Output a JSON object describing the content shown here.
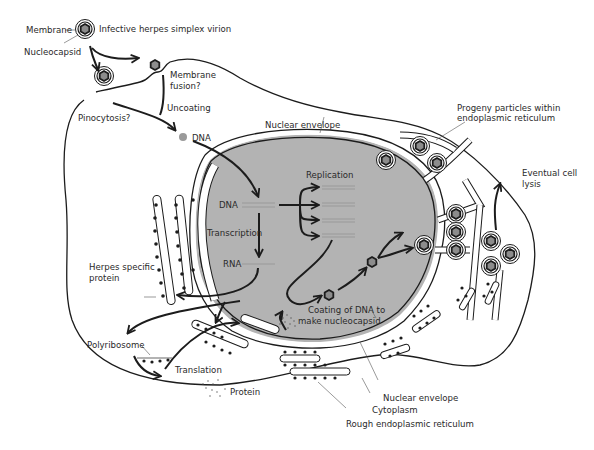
{
  "colors": {
    "nucleus": "#b3b3b3",
    "outline": "#1c1c1c",
    "capsid_core": "#8c8c8c",
    "strand": "#9a9a9a",
    "background": "#ffffff"
  },
  "labels": {
    "virion": "Infective herpes simplex virion",
    "membrane": "Membrane",
    "nucleocapsid": "Nucleocapsid",
    "membrane_fusion_1": "Membrane",
    "membrane_fusion_2": "fusion?",
    "uncoating": "Uncoating",
    "pinocytosis": "Pinocytosis?",
    "dna_cytoplasm": "DNA",
    "nuclear_envelope_top": "Nuclear envelope",
    "progeny_1": "Progeny particles within",
    "progeny_2": "endoplasmic reticulum",
    "replication": "Replication",
    "dna_nucleus": "DNA",
    "transcription": "Transcription",
    "rna": "RNA",
    "herpes_protein_1": "Herpes specific",
    "herpes_protein_2": "protein",
    "lysis_1": "Eventual cell",
    "lysis_2": "lysis",
    "coating_1": "Coating of DNA to",
    "coating_2": "make nucleocapsid",
    "polyribosome": "Polyribosome",
    "translation": "Translation",
    "protein": "Protein",
    "nuclear_envelope_bottom": "Nuclear envelope",
    "cytoplasm": "Cytoplasm",
    "rough_er": "Rough endoplasmic reticulum"
  }
}
